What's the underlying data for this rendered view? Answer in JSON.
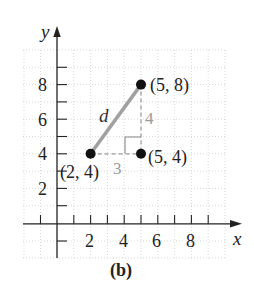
{
  "figure": {
    "caption": "(b)",
    "axes": {
      "x_label": "x",
      "y_label": "y",
      "x_ticks": [
        "2",
        "4",
        "6",
        "8"
      ],
      "y_ticks": [
        "2",
        "4",
        "6",
        "8"
      ],
      "x_range": [
        -1,
        9
      ],
      "y_range": [
        -2,
        10
      ],
      "grid": true
    },
    "points": [
      {
        "label": "(2, 4)",
        "x": 2,
        "y": 4
      },
      {
        "label": "(5, 8)",
        "x": 5,
        "y": 8
      },
      {
        "label": "(5, 4)",
        "x": 5,
        "y": 4
      }
    ],
    "segment_label": "d",
    "horizontal_leg_label": "3",
    "vertical_leg_label": "4",
    "colors": {
      "hypotenuse": "#a0a0a0",
      "legs": "#999999",
      "leg_labels": "#9a9a9a",
      "points": "#111111",
      "grid": "#cfcfcf"
    }
  }
}
